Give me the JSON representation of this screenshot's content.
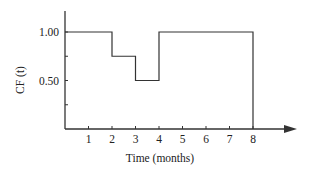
{
  "chart_data": {
    "type": "line",
    "subtype": "step",
    "title": "",
    "xlabel": "Time (months)",
    "ylabel": "CF (t)",
    "x_ticks": [
      1,
      2,
      3,
      4,
      5,
      6,
      7,
      8
    ],
    "y_ticks": [
      {
        "value": 0.25,
        "label": ""
      },
      {
        "value": 0.5,
        "label": "0.50"
      },
      {
        "value": 0.75,
        "label": ""
      },
      {
        "value": 1.0,
        "label": "1.00"
      }
    ],
    "xlim": [
      0,
      9.5
    ],
    "ylim": [
      0,
      1.3
    ],
    "grid": false,
    "legend": null,
    "series": [
      {
        "name": "CF(t)",
        "steps": [
          {
            "x_start": 0,
            "x_end": 2,
            "y": 1.0
          },
          {
            "x_start": 2,
            "x_end": 3,
            "y": 0.75
          },
          {
            "x_start": 3,
            "x_end": 4,
            "y": 0.5
          },
          {
            "x_start": 4,
            "x_end": 8,
            "y": 1.0
          }
        ],
        "drop_to_zero_at": 8
      }
    ],
    "line_color": "#333333"
  }
}
